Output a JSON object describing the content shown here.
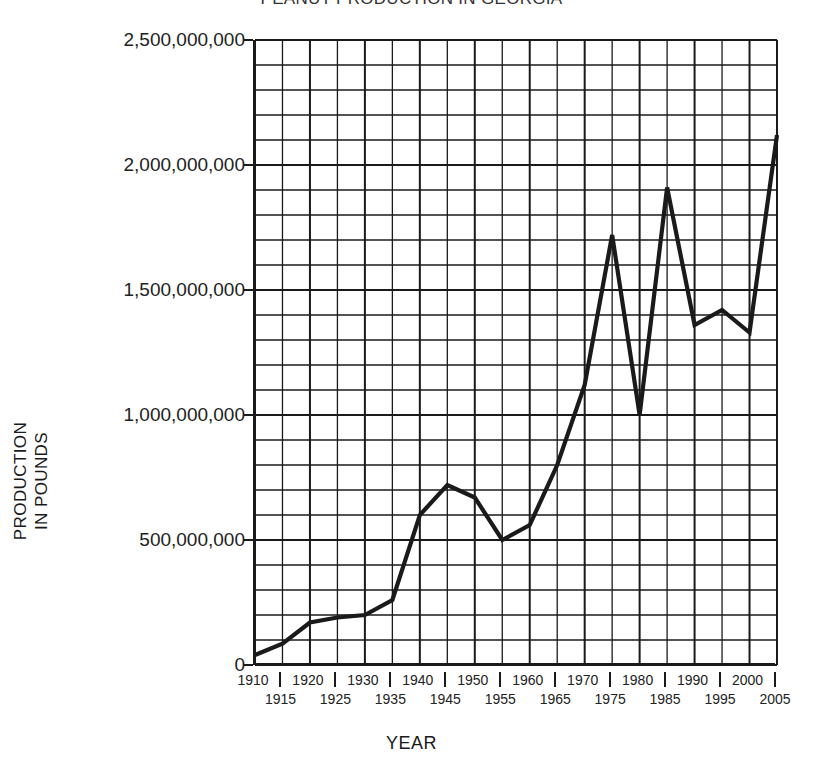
{
  "chart_data": {
    "type": "line",
    "title": "PEANUT PRODUCTION IN GEORGIA",
    "xlabel": "YEAR",
    "ylabel": "PRODUCTION IN POUNDS",
    "ylabel_line1": "PRODUCTION",
    "ylabel_line2": "IN POUNDS",
    "grid": true,
    "legend": "none",
    "line_color": "#1a1a1a",
    "xlim": [
      1910,
      2005
    ],
    "ylim": [
      0,
      2500000000
    ],
    "y_ticks": [
      0,
      500000000,
      1000000000,
      1500000000,
      2000000000,
      2500000000
    ],
    "y_tick_labels": [
      "0",
      "500,000,000",
      "1,000,000,000",
      "1,500,000,000",
      "2,000,000,000",
      "2,500,000,000"
    ],
    "y_minor_step": 100000000,
    "x_ticks": [
      1910,
      1915,
      1920,
      1925,
      1930,
      1935,
      1940,
      1945,
      1950,
      1955,
      1960,
      1965,
      1970,
      1975,
      1980,
      1985,
      1990,
      1995,
      2000,
      2005
    ],
    "x_tick_labels_top": [
      "1910",
      "1920",
      "1930",
      "1940",
      "1950",
      "1960",
      "1970",
      "1980",
      "1990",
      "2000"
    ],
    "x_tick_labels_bottom": [
      "1915",
      "1925",
      "1935",
      "1945",
      "1955",
      "1965",
      "1975",
      "1985",
      "1995",
      "2005"
    ],
    "x": [
      1910,
      1915,
      1920,
      1925,
      1930,
      1935,
      1940,
      1945,
      1950,
      1955,
      1960,
      1965,
      1970,
      1975,
      1980,
      1985,
      1990,
      1995,
      2000,
      2005
    ],
    "values": [
      40000000,
      85000000,
      170000000,
      190000000,
      200000000,
      260000000,
      600000000,
      720000000,
      670000000,
      500000000,
      560000000,
      800000000,
      1120000000,
      1720000000,
      1000000000,
      1910000000,
      1360000000,
      1420000000,
      1330000000,
      2120000000
    ],
    "series": [
      {
        "name": "Peanut production",
        "values": [
          40000000,
          85000000,
          170000000,
          190000000,
          200000000,
          260000000,
          600000000,
          720000000,
          670000000,
          500000000,
          560000000,
          800000000,
          1120000000,
          1720000000,
          1000000000,
          1910000000,
          1360000000,
          1420000000,
          1330000000,
          2120000000
        ]
      }
    ]
  }
}
